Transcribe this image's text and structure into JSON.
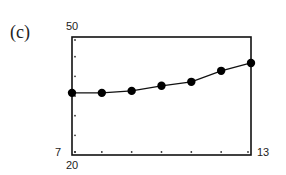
{
  "panel": {
    "label": "(c)"
  },
  "axes": {
    "ymax_label": "50",
    "ymin_label": "20",
    "xmin_label": "7",
    "xmax_label": "13"
  },
  "chart_data": {
    "type": "line",
    "title": "",
    "panel_label": "(c)",
    "xlabel": "",
    "ylabel": "",
    "xlim": [
      7,
      13
    ],
    "ylim": [
      20,
      50
    ],
    "x_ticks_every": 1,
    "y_ticks_every": 5,
    "grid": false,
    "markers": true,
    "x": [
      7,
      8,
      9,
      10,
      11,
      12,
      13
    ],
    "series": [
      {
        "name": "data",
        "values": [
          35.8,
          35.8,
          36.3,
          37.6,
          38.6,
          41.4,
          43.4
        ]
      }
    ],
    "colors": {
      "line": "#111111",
      "marker": "#000000",
      "frame": "#111111"
    }
  }
}
